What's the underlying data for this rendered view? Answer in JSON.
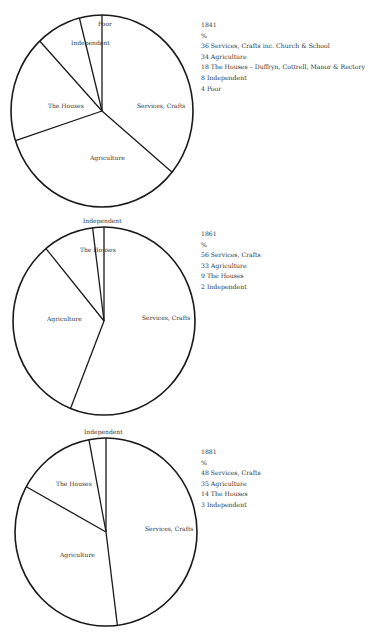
{
  "chart_data": [
    {
      "type": "pie",
      "title": "1841",
      "unit": "%",
      "start_angle": "12 o'clock",
      "direction": "clockwise",
      "labels": [
        "Services, Crafts",
        "Agriculture",
        "The Houses",
        "Independent",
        "Poor"
      ],
      "values": [
        36,
        34,
        18,
        8,
        4
      ],
      "legend_entries": [
        "36 Services, Crafts inc. Church & School",
        "34 Agriculture",
        "18 The Houses – Duffryn, Cottrell, Manor & Rectory",
        "8 Independent",
        "4 Poor"
      ],
      "geometry": {
        "cx": 102,
        "cy": 111,
        "rx": 91,
        "ry": 96
      },
      "label_positions": [
        {
          "x": 137,
          "y": 108
        },
        {
          "x": 90,
          "y": 160
        },
        {
          "x": 48,
          "y": 108
        },
        {
          "x": 71,
          "y": 45
        },
        {
          "x": 98,
          "y": 26
        }
      ],
      "legend_top": 20
    },
    {
      "type": "pie",
      "title": "1861",
      "unit": "%",
      "start_angle": "12 o'clock",
      "direction": "clockwise",
      "labels": [
        "Services, Crafts",
        "Agriculture",
        "The Houses",
        "Independent"
      ],
      "values": [
        56,
        33,
        9,
        2
      ],
      "legend_entries": [
        "56 Services, Crafts",
        "33 Agriculture",
        "9 The Houses",
        "2 Independent"
      ],
      "geometry": {
        "cx": 104,
        "cy": 321,
        "rx": 91,
        "ry": 94
      },
      "label_positions": [
        {
          "x": 142,
          "y": 320
        },
        {
          "x": 47,
          "y": 321
        },
        {
          "x": 80,
          "y": 252
        },
        {
          "x": 83,
          "y": 223
        }
      ],
      "legend_top": 229
    },
    {
      "type": "pie",
      "title": "1881",
      "unit": "%",
      "start_angle": "12 o'clock",
      "direction": "clockwise",
      "labels": [
        "Services, Crafts",
        "Agriculture",
        "The Houses",
        "Independent"
      ],
      "values": [
        48,
        35,
        14,
        3
      ],
      "legend_entries": [
        "48 Services, Crafts",
        "35 Agriculture",
        "14 The Houses",
        "3 Independent"
      ],
      "geometry": {
        "cx": 106,
        "cy": 532,
        "rx": 91,
        "ry": 94
      },
      "label_positions": [
        {
          "x": 145,
          "y": 531
        },
        {
          "x": 60,
          "y": 557
        },
        {
          "x": 56,
          "y": 486
        },
        {
          "x": 84,
          "y": 434
        }
      ],
      "legend_top": 447
    }
  ],
  "legend_unit_label": "%"
}
